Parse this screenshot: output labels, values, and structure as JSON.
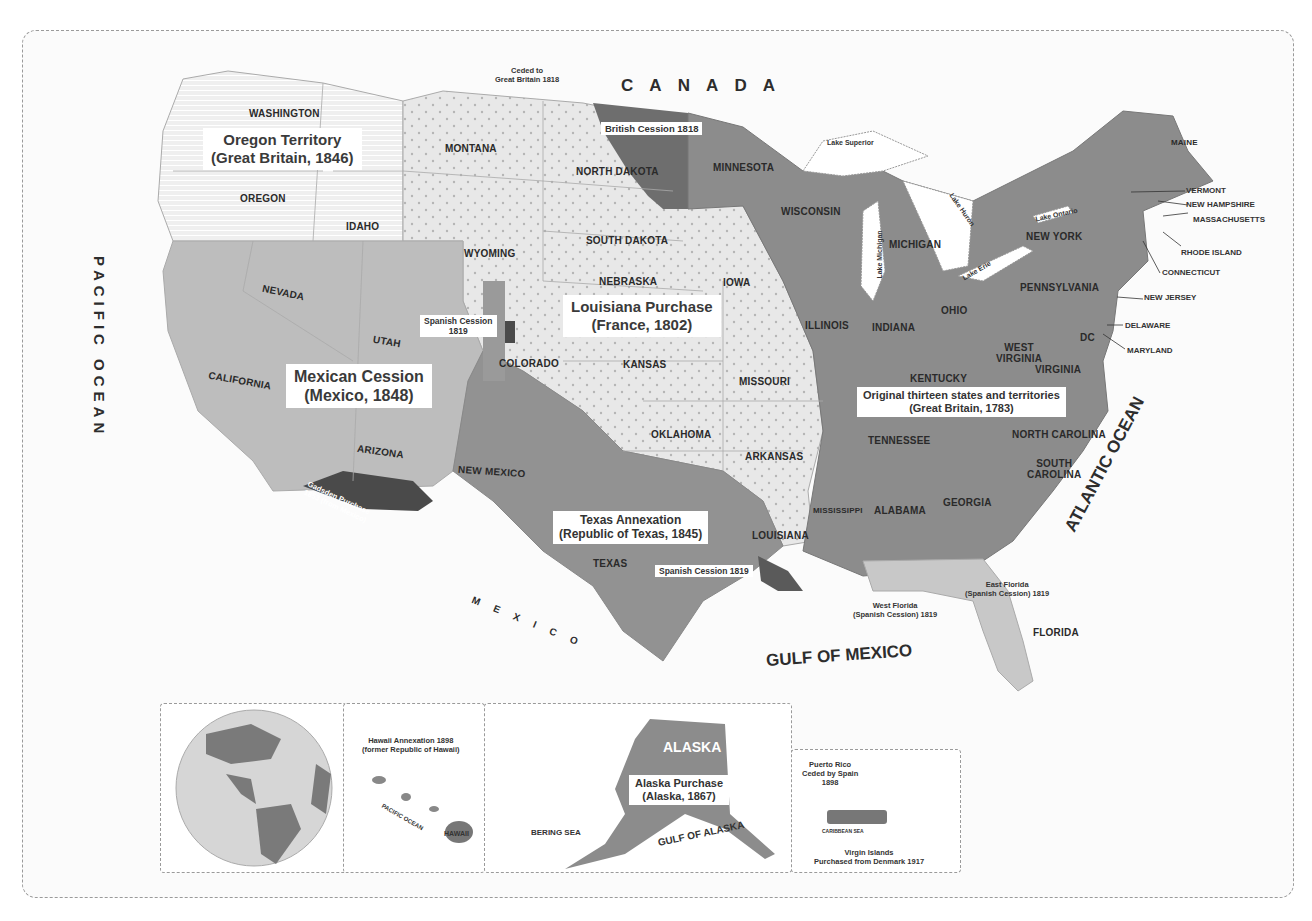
{
  "colors": {
    "original_thirteen": "#8c8c8c",
    "louisiana_purchase": "#e6e6e6",
    "oregon_territory": "#eeeeee",
    "mexican_cession": "#bdbdbd",
    "texas_annexation": "#929292",
    "british_cession": "#6e6e6e",
    "spanish_cession": "#5a5a5a",
    "gadsden": "#4a4a4a",
    "florida": "#c8c8c8",
    "water": "#ffffff",
    "foreign_land": "#ffffff",
    "border": "#9a9a9a"
  },
  "oceans": {
    "pacific": "PACIFIC OCEAN",
    "atlantic": "ATLANTIC OCEAN",
    "gulf": "GULF OF MEXICO",
    "canada": "C A N A D A",
    "mexico": "M E X I C O"
  },
  "acquisitions": {
    "oregon": {
      "title": "Oregon Territory",
      "subtitle": "(Great Britain, 1846)"
    },
    "louisiana": {
      "title": "Louisiana Purchase",
      "subtitle": "(France, 1802)"
    },
    "mexican": {
      "title": "Mexican Cession",
      "subtitle": "(Mexico, 1848)"
    },
    "texas": {
      "title": "Texas Annexation",
      "subtitle": "(Republic of Texas, 1845)"
    },
    "original": {
      "title": "Original thirteen states and territories",
      "subtitle": "(Great Britain, 1783)"
    },
    "british_cession": "British Cession 1818",
    "ceded_gb_line1": "Ceded to",
    "ceded_gb_line2": "Great Britain 1818",
    "spanish_cession_co_line1": "Spanish Cession",
    "spanish_cession_co_line2": "1819",
    "spanish_cession_la": "Spanish Cession 1819",
    "gadsden_line1": "Gadsden Purchase",
    "gadsden_line2": "1853 (from Mexico)",
    "west_florida_line1": "West Florida",
    "west_florida_line2": "(Spanish Cession) 1819",
    "east_florida_line1": "East Florida",
    "east_florida_line2": "(Spanish Cession) 1819"
  },
  "states": {
    "washington": "WASHINGTON",
    "oregon": "OREGON",
    "idaho": "IDAHO",
    "montana": "MONTANA",
    "wyoming": "WYOMING",
    "nevada": "NEVADA",
    "utah": "UTAH",
    "california": "CALIFORNIA",
    "arizona": "ARIZONA",
    "new_mexico": "NEW MEXICO",
    "colorado": "COLORADO",
    "north_dakota": "NORTH DAKOTA",
    "south_dakota": "SOUTH DAKOTA",
    "nebraska": "NEBRASKA",
    "kansas": "KANSAS",
    "oklahoma": "OKLAHOMA",
    "texas": "TEXAS",
    "minnesota": "MINNESOTA",
    "iowa": "IOWA",
    "missouri": "MISSOURI",
    "arkansas": "ARKANSAS",
    "louisiana": "LOUISIANA",
    "wisconsin": "WISCONSIN",
    "michigan": "MICHIGAN",
    "illinois": "ILLINOIS",
    "indiana": "INDIANA",
    "ohio": "OHIO",
    "kentucky": "KENTUCKY",
    "tennessee": "TENNESSEE",
    "mississippi": "MISSISSIPPI",
    "alabama": "ALABAMA",
    "georgia": "GEORGIA",
    "florida": "FLORIDA",
    "south_carolina_1": "SOUTH",
    "south_carolina_2": "CAROLINA",
    "north_carolina": "NORTH CAROLINA",
    "virginia": "VIRGINIA",
    "west_virginia_1": "WEST",
    "west_virginia_2": "VIRGINIA",
    "pennsylvania": "PENNSYLVANIA",
    "new_york": "NEW YORK",
    "maine": "MAINE",
    "dc": "DC",
    "vermont": "VERMONT",
    "new_hampshire": "NEW HAMPSHIRE",
    "massachusetts": "MASSACHUSETTS",
    "rhode_island": "RHODE ISLAND",
    "connecticut": "CONNECTICUT",
    "new_jersey": "NEW JERSEY",
    "delaware": "DELAWARE",
    "maryland": "MARYLAND"
  },
  "lakes": {
    "superior": "Lake Superior",
    "michigan": "Lake Michigan",
    "huron": "Lake Huron",
    "erie": "Lake Erie",
    "ontario": "Lake Ontario"
  },
  "insets": {
    "globe": {
      "atlantic": "ATLANTIC OCEAN",
      "pacific": "PACIFIC OCEAN"
    },
    "hawaii": {
      "line1": "Hawaii Annexation 1898",
      "line2": "(former Republic of Hawaii)",
      "ocean": "PACIFIC OCEAN",
      "island": "HAWAII"
    },
    "alaska": {
      "name": "ALASKA",
      "title": "Alaska Purchase",
      "subtitle": "(Alaska, 1867)",
      "bering": "BERING SEA",
      "gulf": "GULF OF ALASKA"
    },
    "puerto_rico": {
      "line1": "Puerto Rico",
      "line2": "Ceded by Spain",
      "line3": "1898",
      "vi_line1": "Virgin Islands",
      "vi_line2": "Purchased from Denmark 1917",
      "sea": "CARIBBEAN SEA"
    }
  }
}
